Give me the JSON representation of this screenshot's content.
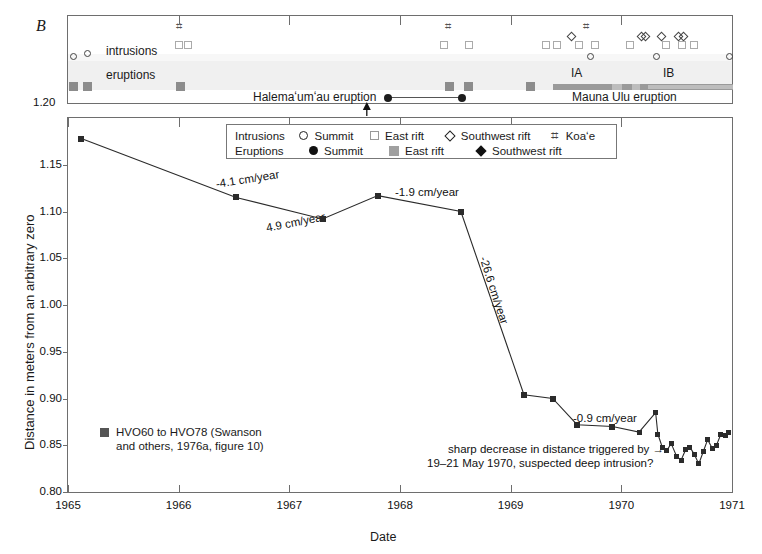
{
  "figure": {
    "panel_label": "B",
    "xlabel": "Date",
    "ylabel": "Distance in meters from an arbitrary zero"
  },
  "top_panel": {
    "row_labels": {
      "intrusions": "intrusions",
      "eruptions": "eruptions"
    },
    "halemaumau_label": "Halemaʻumʻau eruption",
    "mauna_ulu_label": "Mauna Ulu eruption",
    "phase_labels": [
      "IA",
      "IB"
    ],
    "axis_value_at_top_left": "1.20"
  },
  "legend": {
    "rows": [
      {
        "label": "Intrusions",
        "items": [
          {
            "symbol": "open-circle",
            "text": "Summit"
          },
          {
            "symbol": "open-square",
            "text": "East rift"
          },
          {
            "symbol": "open-diamond",
            "text": "Southwest rift"
          },
          {
            "symbol": "koae-hash",
            "text": "Koaʻe"
          }
        ]
      },
      {
        "label": "Eruptions",
        "items": [
          {
            "symbol": "filled-circle",
            "text": "Summit"
          },
          {
            "symbol": "filled-square-gray",
            "text": "East rift"
          },
          {
            "symbol": "filled-diamond",
            "text": "Southwest rift"
          }
        ]
      }
    ]
  },
  "series_legend": {
    "symbol": "filled-square-dark",
    "line1": "HVO60 to HVO78 (Swanson",
    "line2": "and others, 1976a, figure 10)"
  },
  "annotations": [
    {
      "name": "rate-1",
      "text": "-4.1 cm/year"
    },
    {
      "name": "rate-2",
      "text": "4.9 cm/year"
    },
    {
      "name": "rate-3",
      "text": "-1.9 cm/year"
    },
    {
      "name": "rate-4",
      "text": "-26.6 cm/year"
    },
    {
      "name": "rate-5",
      "text": "-0.9 cm/year"
    },
    {
      "name": "note-line1",
      "text": "sharp decrease in distance triggered by →"
    },
    {
      "name": "note-line2",
      "text": "19–21 May 1970, suspected deep intrusion?"
    }
  ],
  "chart_data": {
    "type": "line",
    "title": "",
    "xlabel": "Date",
    "ylabel": "Distance in meters from an arbitrary zero",
    "xlim": [
      1965.0,
      1971.0
    ],
    "ylim": [
      0.8,
      1.2
    ],
    "y_inverted": true,
    "xticks": [
      1965,
      1966,
      1967,
      1968,
      1969,
      1970,
      1971
    ],
    "xticklabels": [
      "1965",
      "1966",
      "1967",
      "1968",
      "1969",
      "1970",
      "1971"
    ],
    "yticks": [
      0.8,
      0.85,
      0.9,
      0.95,
      1.0,
      1.05,
      1.1,
      1.15,
      1.2
    ],
    "yticklabels": [
      "0.80",
      "0.85",
      "0.90",
      "0.95",
      "1.00",
      "1.05",
      "1.10",
      "1.15",
      "1.20"
    ],
    "grid": false,
    "legend_position": "lower-left",
    "series": [
      {
        "name": "HVO60 to HVO78 (Swanson and others, 1976a, figure 10)",
        "marker": "filled-square",
        "color": "#2b2b2b",
        "x": [
          1965.12,
          1966.52,
          1967.3,
          1967.8,
          1968.55,
          1969.12,
          1969.38,
          1969.6,
          1969.92,
          1970.16,
          1970.31,
          1970.33,
          1970.37,
          1970.41,
          1970.45,
          1970.5,
          1970.54,
          1970.58,
          1970.62,
          1970.66,
          1970.7,
          1970.74,
          1970.78,
          1970.82,
          1970.86,
          1970.9,
          1970.94,
          1970.97
        ],
        "y": [
          1.178,
          1.115,
          1.092,
          1.117,
          1.1,
          0.904,
          0.9,
          0.872,
          0.87,
          0.864,
          0.885,
          0.862,
          0.848,
          0.844,
          0.852,
          0.838,
          0.834,
          0.845,
          0.848,
          0.84,
          0.83,
          0.843,
          0.856,
          0.847,
          0.85,
          0.862,
          0.86,
          0.864
        ]
      }
    ],
    "rate_annotations": [
      {
        "text": "-4.1 cm/year",
        "segment": [
          1965.12,
          1966.52
        ]
      },
      {
        "text": "4.9 cm/year",
        "segment": [
          1966.52,
          1967.3
        ]
      },
      {
        "text": "-1.9 cm/year",
        "segment": [
          1967.8,
          1968.55
        ]
      },
      {
        "text": "-26.6 cm/year",
        "segment": [
          1968.55,
          1969.12
        ]
      },
      {
        "text": "-0.9 cm/year",
        "segment": [
          1969.6,
          1970.16
        ]
      }
    ]
  },
  "event_data": {
    "intrusions": {
      "summit_open_circle_x": [
        1965.05,
        1969.72,
        1970.32,
        1970.98
      ],
      "east_rift_open_square_x": [
        1966.0,
        1966.08,
        1968.4,
        1968.62,
        1969.32,
        1969.42,
        1969.62,
        1969.76,
        1970.08,
        1970.4,
        1970.55,
        1970.66
      ],
      "southwest_rift_open_diamond_x": [
        1969.55,
        1970.18,
        1970.22,
        1970.36,
        1970.52,
        1970.56
      ],
      "koae_hash_x": [
        1966.02,
        1968.45,
        1969.7
      ]
    },
    "eruptions": {
      "east_rift_gray_square_x": [
        1965.05,
        1966.02,
        1968.45,
        1968.62,
        1969.18
      ],
      "summit_filled_circle_line": {
        "from_x": 1967.7,
        "to_x": 1968.58
      }
    },
    "mauna_ulu": {
      "start_x": 1969.4,
      "end_x": 1971.0,
      "phase_IA": [
        1969.4,
        1970.02
      ],
      "phase_IB": [
        1970.08,
        1971.0
      ]
    }
  }
}
